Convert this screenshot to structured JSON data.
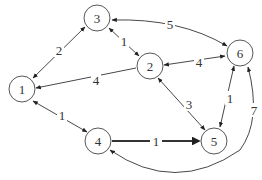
{
  "diagram": {
    "type": "weighted-directed-graph",
    "nodes": [
      {
        "id": "1",
        "label": "1",
        "x": 22,
        "y": 89
      },
      {
        "id": "2",
        "label": "2",
        "x": 150,
        "y": 66
      },
      {
        "id": "3",
        "label": "3",
        "x": 97,
        "y": 18
      },
      {
        "id": "4",
        "label": "4",
        "x": 98,
        "y": 141
      },
      {
        "id": "5",
        "label": "5",
        "x": 215,
        "y": 141
      },
      {
        "id": "6",
        "label": "6",
        "x": 240,
        "y": 52
      }
    ],
    "edges": [
      {
        "from": "1",
        "to": "3",
        "weight": "2",
        "bidirectional": true
      },
      {
        "from": "2",
        "to": "1",
        "weight": "4",
        "bidirectional": false
      },
      {
        "from": "1",
        "to": "4",
        "weight": "1",
        "bidirectional": true
      },
      {
        "from": "3",
        "to": "2",
        "weight": "1",
        "bidirectional": true
      },
      {
        "from": "3",
        "to": "6",
        "weight": "5",
        "bidirectional": true
      },
      {
        "from": "2",
        "to": "6",
        "weight": "4",
        "bidirectional": true
      },
      {
        "from": "2",
        "to": "5",
        "weight": "3",
        "bidirectional": true
      },
      {
        "from": "6",
        "to": "5",
        "weight": "1",
        "bidirectional": true
      },
      {
        "from": "4",
        "to": "5",
        "weight": "1",
        "bidirectional": false,
        "highlighted": true
      },
      {
        "from": "5",
        "to": "6",
        "weight": "7",
        "bidirectional": true,
        "curved": true,
        "note": "curve from node 4 region around to node 6"
      }
    ]
  },
  "labels": {
    "n1": "1",
    "n2": "2",
    "n3": "3",
    "n4": "4",
    "n5": "5",
    "n6": "6",
    "w13": "2",
    "w21": "4",
    "w14": "1",
    "w32": "1",
    "w36": "5",
    "w26": "4",
    "w25": "3",
    "w65": "1",
    "w45": "1",
    "w46": "7"
  },
  "colors": {
    "stroke": "#333333",
    "node_fill": "#ffffff",
    "background": "#ffffff"
  }
}
